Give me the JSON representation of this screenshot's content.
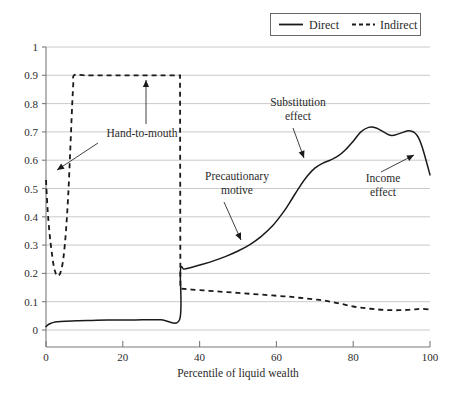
{
  "chart_data": {
    "type": "line",
    "title": "",
    "xlabel": "Percentile of liquid wealth",
    "ylabel": "",
    "xlim": [
      0,
      100
    ],
    "ylim": [
      0,
      1
    ],
    "grid": true,
    "legend_position": "top-right",
    "xticks": [
      "0",
      "20",
      "40",
      "60",
      "80",
      "100"
    ],
    "xtick_values": [
      0,
      20,
      40,
      60,
      80,
      100
    ],
    "yticks": [
      "0",
      "0.1",
      "0.2",
      "0.3",
      "0.4",
      "0.5",
      "0.6",
      "0.7",
      "0.8",
      "0.9",
      "1"
    ],
    "ytick_values": [
      0,
      0.1,
      0.2,
      0.3,
      0.4,
      0.5,
      0.6,
      0.7,
      0.8,
      0.9,
      1.0
    ],
    "series": [
      {
        "name": "Direct",
        "style": "solid",
        "color": "#1a1a1a",
        "x": [
          0,
          0.5,
          1,
          2,
          3,
          5,
          8,
          12,
          16,
          20,
          25,
          30,
          34.8,
          35,
          36,
          38,
          41,
          44,
          47,
          50,
          53,
          56,
          59,
          62,
          64,
          66,
          68,
          70,
          72,
          74,
          76,
          78,
          80,
          82,
          84,
          86,
          88,
          90,
          92,
          94,
          95,
          96,
          97,
          98,
          99,
          100
        ],
        "y": [
          0.012,
          0.018,
          0.022,
          0.027,
          0.029,
          0.031,
          0.033,
          0.034,
          0.035,
          0.035,
          0.036,
          0.036,
          0.037,
          0.21,
          0.215,
          0.222,
          0.233,
          0.246,
          0.261,
          0.279,
          0.301,
          0.33,
          0.368,
          0.42,
          0.462,
          0.505,
          0.543,
          0.572,
          0.589,
          0.6,
          0.614,
          0.637,
          0.667,
          0.7,
          0.716,
          0.714,
          0.699,
          0.687,
          0.694,
          0.703,
          0.703,
          0.697,
          0.68,
          0.645,
          0.598,
          0.548
        ]
      },
      {
        "name": "Indirect",
        "style": "dashed",
        "color": "#1a1a1a",
        "x": [
          0,
          0.4,
          0.9,
          1.4,
          1.9,
          2.4,
          2.9,
          3.4,
          4,
          4.6,
          5.2,
          5.8,
          6.3,
          6.8,
          7.1,
          7.3,
          10,
          14,
          18,
          22,
          26,
          30,
          34,
          34.9,
          35,
          36,
          38,
          41,
          44,
          47,
          50,
          53,
          56,
          59,
          62,
          64,
          66,
          68,
          70,
          72,
          74,
          76,
          78,
          80,
          82,
          84,
          86,
          88,
          90,
          92,
          94,
          96,
          98,
          100
        ],
        "y": [
          0.53,
          0.43,
          0.345,
          0.285,
          0.235,
          0.205,
          0.192,
          0.193,
          0.213,
          0.262,
          0.35,
          0.48,
          0.63,
          0.79,
          0.868,
          0.9,
          0.9,
          0.9,
          0.9,
          0.9,
          0.9,
          0.9,
          0.9,
          0.9,
          0.146,
          0.145,
          0.143,
          0.14,
          0.137,
          0.134,
          0.131,
          0.128,
          0.125,
          0.122,
          0.119,
          0.117,
          0.114,
          0.111,
          0.108,
          0.105,
          0.1,
          0.095,
          0.089,
          0.083,
          0.079,
          0.076,
          0.073,
          0.071,
          0.07,
          0.07,
          0.071,
          0.073,
          0.075,
          0.072
        ]
      }
    ],
    "annotations": [
      {
        "name": "hand-to-mouth",
        "label_lines": [
          "Hand-to-mouth"
        ],
        "label_x": 142,
        "label_y": 137,
        "arrows": [
          {
            "from_x": 146,
            "from_y": 124,
            "to_x": 146,
            "to_y": 80
          },
          {
            "from_x": 98,
            "from_y": 143,
            "to_x": 57,
            "to_y": 170
          }
        ]
      },
      {
        "name": "precautionary-motive",
        "label_lines": [
          "Precautionary",
          "motive"
        ],
        "label_x": 237,
        "label_y": 180,
        "arrows": [
          {
            "from_x": 224,
            "from_y": 202,
            "to_x": 241,
            "to_y": 240
          }
        ]
      },
      {
        "name": "substitution-effect",
        "label_lines": [
          "Substitution",
          "effect"
        ],
        "label_x": 298,
        "label_y": 106,
        "arrows": [
          {
            "from_x": 293,
            "from_y": 128,
            "to_x": 304,
            "to_y": 158
          }
        ]
      },
      {
        "name": "income-effect",
        "label_lines": [
          "Income",
          "effect"
        ],
        "label_x": 383,
        "label_y": 182,
        "arrows": [
          {
            "from_x": 381,
            "from_y": 172,
            "to_x": 414,
            "to_y": 155
          }
        ]
      }
    ]
  },
  "legend": {
    "items": [
      {
        "label": "Direct",
        "style": "solid"
      },
      {
        "label": "Indirect",
        "style": "dashed"
      }
    ]
  },
  "axis": {
    "x_title": "Percentile of liquid wealth"
  }
}
